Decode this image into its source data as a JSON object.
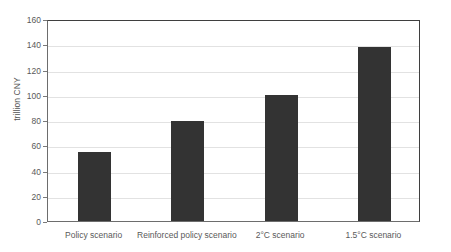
{
  "chart_data": {
    "type": "bar",
    "title": "",
    "xlabel": "",
    "ylabel": "trillion CNY",
    "categories": [
      "Policy scenario",
      "Reinforced policy scenario",
      "2°C scenario",
      "1.5°C scenario"
    ],
    "values": [
      55,
      79,
      100,
      138
    ],
    "ylim": [
      0,
      160
    ],
    "ytick_labels": [
      "0",
      "20",
      "40",
      "60",
      "80",
      "100",
      "120",
      "140",
      "160"
    ],
    "ytick_values": [
      0,
      20,
      40,
      60,
      80,
      100,
      120,
      140,
      160
    ],
    "grid": true,
    "legend": false,
    "bar_color": "#333333",
    "grid_color": "#e2e2e2",
    "axis_color": "#6d6d6d"
  }
}
